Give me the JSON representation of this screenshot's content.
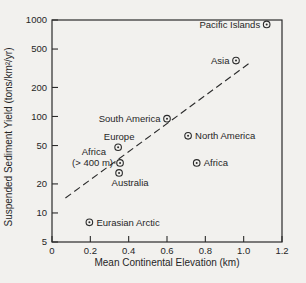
{
  "figure": {
    "background": "#f2f1ee",
    "ink": "#2b2b2b"
  },
  "chart_data": {
    "type": "scatter",
    "title": "",
    "xlabel": "Mean Continental Elevation (km)",
    "ylabel": "Suspended Sediment Yield (tons/km²/yr)",
    "xlim": [
      0,
      1.2
    ],
    "ylim": [
      5,
      1000
    ],
    "xscale": "linear",
    "yscale": "log",
    "grid": false,
    "legend": "none",
    "xticks": [
      {
        "value": 0,
        "label": "0"
      },
      {
        "value": 0.2,
        "label": "0.2"
      },
      {
        "value": 0.4,
        "label": "0.4"
      },
      {
        "value": 0.6,
        "label": "0.6"
      },
      {
        "value": 0.8,
        "label": "0.8"
      },
      {
        "value": 1.0,
        "label": "1.0"
      },
      {
        "value": 1.2,
        "label": "1.2"
      }
    ],
    "yticks": [
      {
        "value": 1000,
        "label": "1000"
      },
      {
        "value": 500,
        "label": "500"
      },
      {
        "value": 200,
        "label": "200"
      },
      {
        "value": 100,
        "label": "100"
      },
      {
        "value": 50,
        "label": "50"
      },
      {
        "value": 20,
        "label": "20"
      },
      {
        "value": 10,
        "label": "10"
      },
      {
        "value": 5,
        "label": "5"
      }
    ],
    "points": [
      {
        "name": "Pacific Islands",
        "x": 1.12,
        "y": 900,
        "label_placement": "left"
      },
      {
        "name": "Asia",
        "x": 0.96,
        "y": 380,
        "label_placement": "left"
      },
      {
        "name": "South America",
        "x": 0.6,
        "y": 95,
        "label_placement": "left"
      },
      {
        "name": "North America",
        "x": 0.71,
        "y": 63,
        "label_placement": "right"
      },
      {
        "name": "Europe",
        "x": 0.345,
        "y": 48,
        "label_placement": "above"
      },
      {
        "name": "Africa (> 400 m)",
        "x": 0.355,
        "y": 33,
        "label_placement": "left2",
        "label_lines": [
          "Africa",
          "(> 400 m)"
        ],
        "connector": true
      },
      {
        "name": "Africa",
        "x": 0.755,
        "y": 33,
        "label_placement": "right"
      },
      {
        "name": "Australia",
        "x": 0.35,
        "y": 26,
        "label_placement": "below"
      },
      {
        "name": "Eurasian Arctic",
        "x": 0.195,
        "y": 8,
        "label_placement": "right"
      }
    ],
    "trendline": {
      "style": "dashed",
      "x1": 0.07,
      "y1": 14.3,
      "x2": 1.03,
      "y2": 357
    }
  }
}
